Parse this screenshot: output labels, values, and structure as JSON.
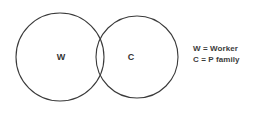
{
  "diagram": {
    "type": "venn-two-set",
    "background_color": "#ffffff",
    "stroke_color": "#3a3a3a",
    "text_color": "#333333",
    "sets": [
      {
        "id": "W",
        "label": "W",
        "cx": 60,
        "cy": 57,
        "r": 44
      },
      {
        "id": "C",
        "label": "C",
        "cx": 137,
        "cy": 57,
        "r": 41
      }
    ],
    "legend": {
      "entries": [
        {
          "symbol": "W",
          "equals": "=",
          "meaning": "Worker",
          "text": "W = Worker"
        },
        {
          "symbol": "C",
          "equals": "=",
          "meaning": "P family",
          "text": "C = P family"
        }
      ]
    }
  }
}
